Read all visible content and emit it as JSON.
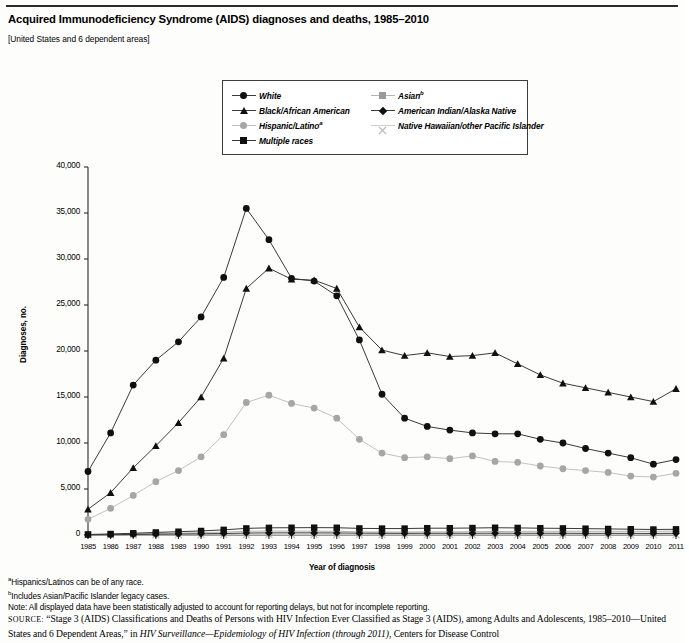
{
  "header": {
    "title": "Acquired Immunodeficiency Syndrome (AIDS) diagnoses and deaths, 1985–2010",
    "subtitle": "[United States and 6 dependent areas]"
  },
  "footnotes": {
    "a": "Hispanics/Latinos can be of any race.",
    "b": "Includes Asian/Pacific Islander legacy cases.",
    "note": "Note: All displayed data have been statistically adjusted to account for reporting delays, but not for incomplete reporting.",
    "source_label": "SOURCE:",
    "source_line1": "“Stage 3 (AIDS) Classifications and Deaths of Persons with HIV Infection Ever Classified as Stage 3 (AIDS), among Adults and Adolescents,",
    "source_line2_a": "1985–2010—United States and 6 Dependent Areas,” in ",
    "source_line2_italic": "HIV Surveillance—Epidemiology of HIV Infection (through 2011)",
    "source_line2_b": ", Centers for Disease Control"
  },
  "chart_data": {
    "type": "line",
    "title": "Acquired Immunodeficiency Syndrome (AIDS) diagnoses and deaths, 1985–2010",
    "xlabel": "Year of diagnosis",
    "ylabel": "Diagnoses, no.",
    "ylim": [
      0,
      40000
    ],
    "ytick_values": [
      0,
      5000,
      10000,
      15000,
      20000,
      25000,
      30000,
      35000,
      40000
    ],
    "ytick_labels": [
      "0",
      "5,000",
      "10,000",
      "15,000",
      "20,000",
      "25,000",
      "30,000",
      "35,000",
      "40,000"
    ],
    "grid": false,
    "legend_position": "top-center",
    "categories": [
      1985,
      1986,
      1987,
      1988,
      1989,
      1990,
      1991,
      1992,
      1993,
      1994,
      1995,
      1996,
      1997,
      1998,
      1999,
      2000,
      2001,
      2002,
      2003,
      2004,
      2005,
      2006,
      2007,
      2008,
      2009,
      2010,
      2011
    ],
    "xtick_labels": [
      "1985",
      "1986",
      "1987",
      "1988",
      "1989",
      "1990",
      "1991",
      "1992",
      "1993",
      "1994",
      "1995",
      "1996",
      "1997",
      "1998",
      "1999",
      "2000",
      "2001",
      "2002",
      "2003",
      "2004",
      "2005",
      "2006",
      "2007",
      "2008",
      "2009",
      "2010",
      "2011"
    ],
    "series": [
      {
        "name": "White",
        "marker": "circle",
        "color": "#101010",
        "line_color": "#3a3a3a",
        "values": [
          6900,
          11100,
          16300,
          19000,
          21000,
          23700,
          28000,
          35500,
          32100,
          27900,
          27600,
          26000,
          21200,
          15300,
          12700,
          11800,
          11400,
          11100,
          11000,
          11000,
          10400,
          10000,
          9400,
          8900,
          8400,
          7700,
          8200
        ]
      },
      {
        "name": "Black/African American",
        "marker": "triangle",
        "color": "#101010",
        "line_color": "#3a3a3a",
        "values": [
          2800,
          4600,
          7300,
          9700,
          12200,
          15000,
          19200,
          26800,
          29000,
          27800,
          27700,
          26800,
          22600,
          20100,
          19500,
          19800,
          19400,
          19500,
          19800,
          18600,
          17400,
          16500,
          16000,
          15500,
          15000,
          14500,
          15900
        ]
      },
      {
        "name": "Hispanic/Latino",
        "marker": "circle-gray",
        "color": "#a6a6a6",
        "line_color": "#c2c2c2",
        "values": [
          1700,
          2900,
          4300,
          5800,
          7000,
          8500,
          10900,
          14400,
          15200,
          14300,
          13800,
          12700,
          10400,
          8900,
          8400,
          8500,
          8300,
          8600,
          8000,
          7900,
          7500,
          7200,
          7000,
          6800,
          6400,
          6300,
          6700
        ]
      },
      {
        "name": "Asian",
        "marker": "square-gray",
        "color": "#9a9a9a",
        "line_color": "#b5b5b5",
        "values": [
          40,
          70,
          120,
          170,
          210,
          250,
          310,
          400,
          430,
          420,
          410,
          400,
          340,
          320,
          320,
          340,
          340,
          360,
          380,
          390,
          400,
          400,
          400,
          400,
          400,
          390,
          420
        ]
      },
      {
        "name": "American Indian/Alaska Native",
        "marker": "diamond",
        "color": "#101010",
        "line_color": "#3a3a3a",
        "values": [
          20,
          40,
          60,
          90,
          110,
          130,
          160,
          210,
          230,
          230,
          230,
          220,
          200,
          190,
          180,
          190,
          190,
          190,
          200,
          190,
          190,
          190,
          180,
          180,
          180,
          170,
          180
        ]
      },
      {
        "name": "Native Hawaiian/other Pacific Islander",
        "marker": "x-gray",
        "color": "#bdbdbd",
        "line_color": "#cfcfcf",
        "values": [
          5,
          8,
          12,
          16,
          20,
          24,
          30,
          38,
          42,
          42,
          42,
          40,
          35,
          32,
          30,
          32,
          32,
          34,
          36,
          36,
          36,
          36,
          34,
          34,
          34,
          32,
          34
        ]
      },
      {
        "name": "Multiple races",
        "marker": "square",
        "color": "#101010",
        "line_color": "#3a3a3a",
        "values": [
          60,
          110,
          190,
          280,
          360,
          440,
          560,
          720,
          780,
          790,
          800,
          790,
          720,
          700,
          700,
          740,
          740,
          760,
          790,
          770,
          740,
          720,
          690,
          660,
          630,
          600,
          620
        ]
      }
    ]
  },
  "legend": {
    "left_items": [
      {
        "label": "White",
        "marker": "circle",
        "sup": ""
      },
      {
        "label": "Black/African American",
        "marker": "triangle",
        "sup": ""
      },
      {
        "label": "Hispanic/Latino",
        "marker": "circle-gray",
        "sup": "a"
      },
      {
        "label": "Multiple races",
        "marker": "square",
        "sup": ""
      }
    ],
    "right_items": [
      {
        "label": "Asian",
        "marker": "square-gray",
        "sup": "b"
      },
      {
        "label": "American Indian/Alaska Native",
        "marker": "diamond",
        "sup": ""
      },
      {
        "label": "Native Hawaiian/other Pacific Islander",
        "marker": "x-gray",
        "sup": ""
      }
    ]
  }
}
